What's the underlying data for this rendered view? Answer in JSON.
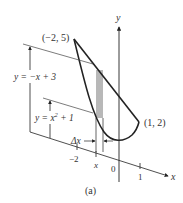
{
  "figure": {
    "caption": "(a)",
    "axes": {
      "x_label": "x",
      "y_label": "y",
      "x_ticks": [
        "−2",
        "x",
        "0",
        "1"
      ]
    },
    "curves": {
      "upper": {
        "equation": "y = −x + 3"
      },
      "lower": {
        "equation_prefix": "y = x",
        "equation_exp": "2",
        "equation_suffix": " + 1"
      }
    },
    "points": [
      {
        "label": "(−2, 5)"
      },
      {
        "label": "(1, 2)"
      }
    ],
    "strip": {
      "width_label": "Δx"
    },
    "colors": {
      "ink": "#222222",
      "strip_fill": "#b8b8b8"
    }
  }
}
